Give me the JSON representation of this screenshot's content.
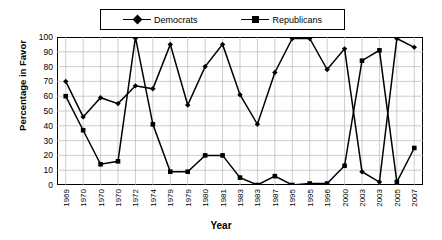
{
  "chart_data": {
    "type": "line",
    "title": "",
    "xlabel": "Year",
    "ylabel": "Percentage in Favor",
    "ylim": [
      0,
      100
    ],
    "yticks": [
      0,
      10,
      20,
      30,
      40,
      50,
      60,
      70,
      80,
      90,
      100
    ],
    "grid": true,
    "legend_position": "top",
    "categories": [
      "1969",
      "1970",
      "1970",
      "1970",
      "1972",
      "1974",
      "1979",
      "1979",
      "1980",
      "1981",
      "1983",
      "1983",
      "1987",
      "1995",
      "1995",
      "1996",
      "2000",
      "2003",
      "2003",
      "2005",
      "2007"
    ],
    "series": [
      {
        "name": "Democrats",
        "marker": "diamond",
        "color": "#000000",
        "values": [
          70,
          46,
          59,
          55,
          67,
          65,
          95,
          54,
          80,
          95,
          61,
          41,
          76,
          99,
          99,
          78,
          92,
          9,
          2,
          99,
          93
        ]
      },
      {
        "name": "Republicans",
        "marker": "square",
        "color": "#000000",
        "values": [
          60,
          37,
          14,
          16,
          100,
          41,
          9,
          9,
          20,
          20,
          5,
          0,
          6,
          0,
          1,
          1,
          13,
          84,
          91,
          2,
          25
        ]
      }
    ]
  },
  "legend": {
    "entries": [
      {
        "label": "Democrats"
      },
      {
        "label": "Republicans"
      }
    ]
  },
  "axes": {
    "x_title": "Year",
    "y_title": "Percentage in Favor"
  }
}
